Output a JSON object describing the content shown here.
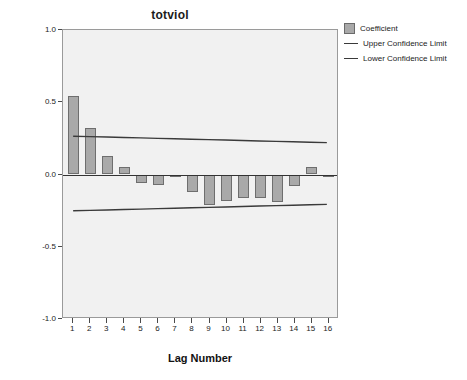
{
  "chart_data": {
    "type": "bar",
    "title": "totviol",
    "xlabel": "Lag Number",
    "ylabel": "ACF",
    "categories": [
      1,
      2,
      3,
      4,
      5,
      6,
      7,
      8,
      9,
      10,
      11,
      12,
      13,
      14,
      15,
      16
    ],
    "values": [
      0.54,
      0.32,
      0.13,
      0.05,
      -0.06,
      -0.07,
      -0.02,
      -0.12,
      -0.21,
      -0.18,
      -0.16,
      -0.16,
      -0.19,
      -0.08,
      0.05,
      -0.01
    ],
    "ylim": [
      -1.0,
      1.0
    ],
    "xlim": [
      0.4,
      16.6
    ],
    "ytick_labels": [
      "1.0",
      "0.5",
      "0.0",
      "-0.5",
      "-1.0"
    ],
    "ytick_values": [
      1.0,
      0.5,
      0.0,
      -0.5,
      -1.0
    ],
    "xtick_labels": [
      "1",
      "2",
      "3",
      "4",
      "5",
      "6",
      "7",
      "8",
      "9",
      "10",
      "11",
      "12",
      "13",
      "14",
      "15",
      "16"
    ],
    "grid": false,
    "legend_position": "top-right",
    "series": [
      {
        "name": "Coefficient",
        "kind": "bar",
        "values": [
          0.54,
          0.32,
          0.13,
          0.05,
          -0.06,
          -0.07,
          -0.02,
          -0.12,
          -0.21,
          -0.18,
          -0.16,
          -0.16,
          -0.19,
          -0.08,
          0.05,
          -0.01
        ]
      },
      {
        "name": "Upper Confidence Limit",
        "kind": "line",
        "values": [
          0.26,
          0.257,
          0.254,
          0.251,
          0.248,
          0.245,
          0.242,
          0.239,
          0.236,
          0.233,
          0.23,
          0.227,
          0.224,
          0.221,
          0.218,
          0.215
        ]
      },
      {
        "name": "Lower Confidence Limit",
        "kind": "line",
        "values": [
          -0.26,
          -0.257,
          -0.254,
          -0.251,
          -0.248,
          -0.245,
          -0.242,
          -0.239,
          -0.236,
          -0.233,
          -0.23,
          -0.227,
          -0.224,
          -0.221,
          -0.218,
          -0.215
        ]
      }
    ],
    "colors": {
      "bar_fill": "#a9a9a9",
      "bar_border": "#6e6e6e",
      "line": "#3a3a3a",
      "zero_line": "#333333",
      "plot_background": "#f1f1f1",
      "frame": "#9a9a9a",
      "text": "#1b1b1b"
    }
  },
  "legend": {
    "items": [
      {
        "label": "Coefficient",
        "marker": "box"
      },
      {
        "label": "Upper Confidence Limit",
        "marker": "line"
      },
      {
        "label": "Lower Confidence Limit",
        "marker": "line"
      }
    ]
  }
}
